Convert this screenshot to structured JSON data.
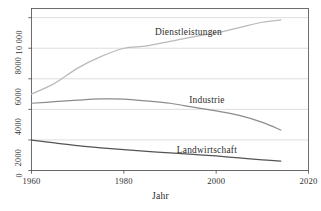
{
  "chart_data": {
    "type": "line",
    "title": "",
    "xlabel": "Jahr",
    "ylabel": "",
    "xlim": [
      1960,
      2020
    ],
    "ylim": [
      0,
      10600
    ],
    "grid": true,
    "legend_position": "inline-labels",
    "xticks": [
      1960,
      1980,
      2000,
      2020
    ],
    "xtick_labels": [
      "1960",
      "1980",
      "2000",
      "2020"
    ],
    "yticks": [
      0,
      2000,
      4000,
      6000,
      8000,
      10000
    ],
    "ytick_labels": [
      "0",
      "2000",
      "4000",
      "6000",
      "8000",
      "10 000"
    ],
    "x": [
      1960,
      1965,
      1970,
      1975,
      1980,
      1985,
      1990,
      1995,
      2000,
      2005,
      2010,
      2014
    ],
    "series": [
      {
        "name": "Dienstleistungen",
        "color": "#b9b9b9",
        "values": [
          5000,
          5700,
          6700,
          7450,
          8000,
          8150,
          8450,
          8750,
          9000,
          9350,
          9700,
          9850
        ],
        "label_x": 1994,
        "label_y_px": 28
      },
      {
        "name": "Industrie",
        "color": "#8c8c8c",
        "values": [
          4400,
          4500,
          4600,
          4680,
          4670,
          4550,
          4400,
          4150,
          3900,
          3600,
          3150,
          2650
        ],
        "label_x": 1998,
        "label_y_px": 96
      },
      {
        "name": "Landwirtschaft",
        "color": "#545454",
        "values": [
          1980,
          1800,
          1620,
          1480,
          1360,
          1250,
          1150,
          1050,
          950,
          820,
          700,
          620
        ],
        "label_x": 1998,
        "label_y_px": 146
      }
    ]
  },
  "axes": {
    "xaxis_title": "Jahr",
    "grid_color": "#cfcfcf",
    "frame_color": "#4a4a4a",
    "background": "#ffffff"
  }
}
